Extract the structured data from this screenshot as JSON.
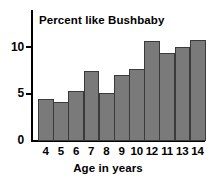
{
  "chart_data": {
    "type": "bar",
    "title": "Percent like Bushbaby",
    "xlabel": "Age in years",
    "ylabel": "",
    "categories": [
      "4",
      "5",
      "6",
      "7",
      "8",
      "9",
      "10",
      "12",
      "11",
      "13",
      "14"
    ],
    "values": [
      4.4,
      4.1,
      5.3,
      7.4,
      5.1,
      7.0,
      7.7,
      10.6,
      9.4,
      10.0,
      10.7
    ],
    "ylim": [
      0,
      11.5
    ],
    "xlim_note": "categorical, 11 adjacent bars",
    "yticks": [
      0,
      5,
      10
    ],
    "ytick_labels": [
      "0",
      "5",
      "10"
    ],
    "grid": false,
    "legend": false,
    "bar_fill": "#7a7a7a",
    "bar_edge": "#3a3a3a",
    "axis_color": "#000000",
    "background": "#ffffff"
  },
  "axes": {
    "y_axis_name": "percent-axis",
    "x_axis_name": "age-axis"
  }
}
